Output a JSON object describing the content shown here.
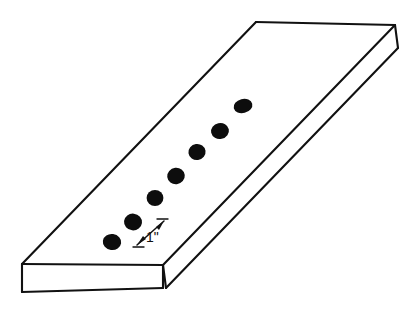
{
  "figure": {
    "background_color": "#ffffff",
    "line_color": "#111111",
    "dot_color": "#0d0d0d",
    "face_fill": "#ffffff",
    "stroke_width": 2.1
  },
  "slab": {
    "name": "rectangular-plate",
    "top_face": {
      "label": "top-face",
      "points": "22,264 256,22 395,25 163,265"
    },
    "front_face": {
      "label": "front-face",
      "points": "22,264 163,265 163,288 22,292"
    },
    "right_face": {
      "label": "right-side-face",
      "points": "163,265 395,25 398,48 166,288"
    },
    "edges": [
      {
        "name": "top-face-left-edge",
        "d": "M22,264 L256,22"
      },
      {
        "name": "top-face-far-edge",
        "d": "M256,22 L395,25"
      },
      {
        "name": "top-face-right-edge",
        "d": "M395,25 L163,265"
      },
      {
        "name": "top-face-near-edge",
        "d": "M163,265 L22,264"
      },
      {
        "name": "front-face-left-edge",
        "d": "M22,264 L22,292"
      },
      {
        "name": "front-face-bottom-edge",
        "d": "M22,292 L163,288"
      },
      {
        "name": "front-face-right-edge",
        "d": "M163,288 L163,265"
      },
      {
        "name": "right-face-far-edge",
        "d": "M395,25 L398,48"
      },
      {
        "name": "right-face-bottom-edge",
        "d": "M398,48 L166,288"
      },
      {
        "name": "right-face-near-edge",
        "d": "M166,288 L163,265"
      }
    ]
  },
  "holes": {
    "count": 7,
    "description": "row of drilled holes along the slab length",
    "items": [
      {
        "name": "hole-1",
        "cx": 243,
        "cy": 106,
        "rx": 9.5,
        "ry": 7.0,
        "rot": -14
      },
      {
        "name": "hole-2",
        "cx": 220,
        "cy": 131,
        "rx": 9.0,
        "ry": 8.0,
        "rot": -12
      },
      {
        "name": "hole-3",
        "cx": 197,
        "cy": 152,
        "rx": 8.6,
        "ry": 8.0,
        "rot": -8
      },
      {
        "name": "hole-4",
        "cx": 176,
        "cy": 176,
        "rx": 8.8,
        "ry": 8.2,
        "rot": -6
      },
      {
        "name": "hole-5",
        "cx": 155,
        "cy": 198,
        "rx": 8.4,
        "ry": 8.0,
        "rot": 0
      },
      {
        "name": "hole-6",
        "cx": 133,
        "cy": 222,
        "rx": 9.0,
        "ry": 8.4,
        "rot": 6
      },
      {
        "name": "hole-7",
        "cx": 112,
        "cy": 242,
        "rx": 9.2,
        "ry": 8.0,
        "rot": 8
      }
    ]
  },
  "dimension": {
    "name": "hole-spacing-dimension",
    "label": "1\"",
    "value": 1,
    "unit": "inch",
    "arrow_line": "M137,245 L164,221",
    "arrow_head_start": "137,245 146,239 143,236",
    "arrow_head_end": "164,221 156,227 159,230",
    "tick_top": "M157,219 L168,219",
    "tick_bottom": "M133,247 L144,247",
    "text_x": 146,
    "text_y": 242
  }
}
